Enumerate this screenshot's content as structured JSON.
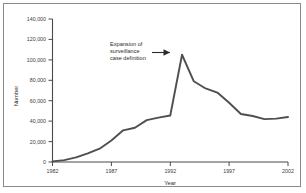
{
  "figure": {
    "frame_color": "#8a8a8a",
    "background": "#ffffff"
  },
  "chart_data": {
    "type": "line",
    "title": "",
    "subtitle": "",
    "xlabel": "Year",
    "ylabel": "Number",
    "xlim": [
      1982,
      2002
    ],
    "ylim": [
      0,
      140000
    ],
    "grid": false,
    "legend": null,
    "legend_position": "none",
    "line_color": "#4f4f4f",
    "xticks": [
      1982,
      1987,
      1992,
      1997,
      2002
    ],
    "xtick_labels": [
      "1982",
      "1987",
      "1992",
      "1997",
      "2002"
    ],
    "yticks": [
      0,
      20000,
      40000,
      60000,
      80000,
      100000,
      120000,
      140000
    ],
    "ytick_labels": [
      "0",
      "20,000",
      "40,000",
      "60,000",
      "80,000",
      "100,000",
      "120,000",
      "140,000"
    ],
    "x": [
      1982,
      1983,
      1984,
      1985,
      1986,
      1987,
      1988,
      1989,
      1990,
      1991,
      1992,
      1993,
      1994,
      1995,
      1996,
      1997,
      1998,
      1999,
      2000,
      2001,
      2002
    ],
    "values": [
      600,
      1800,
      4500,
      8500,
      13000,
      21000,
      31000,
      33500,
      41000,
      43500,
      45500,
      105000,
      79000,
      72000,
      68000,
      58000,
      47000,
      45000,
      42000,
      42500,
      44000
    ],
    "series": [
      {
        "name": "Number of cases",
        "values": [
          600,
          1800,
          4500,
          8500,
          13000,
          21000,
          31000,
          33500,
          41000,
          43500,
          45500,
          105000,
          79000,
          72000,
          68000,
          58000,
          47000,
          45000,
          42000,
          42500,
          44000
        ]
      }
    ],
    "annotations": [
      {
        "text_lines": [
          "Expansion of",
          "surveillance",
          "case definition"
        ],
        "points_to_x": 1993,
        "points_to_y": 105000,
        "arrow": "right-arrow-icon"
      }
    ]
  }
}
